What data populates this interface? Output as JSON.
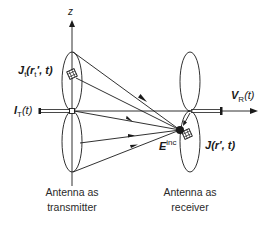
{
  "diagram": {
    "axis_label": "z",
    "transmitter": {
      "current_density_label": {
        "base": "J",
        "sub": "t",
        "args": "(r",
        "args_sub": "t",
        "args_rest": "′, t)"
      },
      "input_current_label": {
        "base": "I",
        "sub": "T",
        "args": "(t)"
      },
      "caption_line1": "Antenna as",
      "caption_line2": "transmitter"
    },
    "receiver": {
      "voltage_label": {
        "base": "V",
        "sub": "R",
        "args": "(t)"
      },
      "current_density_label": {
        "base": "J",
        "args": "(r′, t)"
      },
      "caption_line1": "Antenna as",
      "caption_line2": "receiver"
    },
    "incident_field_label": {
      "base": "E",
      "sup": "inc"
    },
    "colors": {
      "stroke": "#1a1a1a",
      "background": "#ffffff"
    }
  }
}
